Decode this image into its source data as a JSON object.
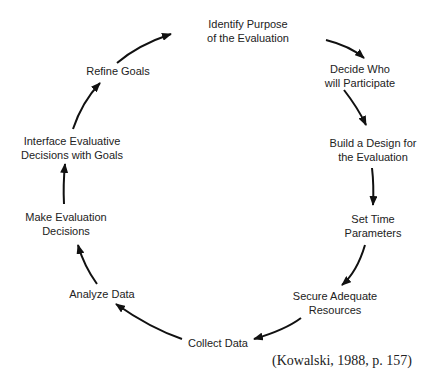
{
  "diagram": {
    "type": "cycle",
    "steps": [
      {
        "line1": "Identify Purpose",
        "line2": "of the Evaluation"
      },
      {
        "line1": "Decide Who",
        "line2": "will Participate"
      },
      {
        "line1": "Build a Design for",
        "line2": "the Evaluation"
      },
      {
        "line1": "Set Time",
        "line2": "Parameters"
      },
      {
        "line1": "Secure Adequate",
        "line2": "Resources"
      },
      {
        "line1": "Collect Data",
        "line2": ""
      },
      {
        "line1": "Analyze Data",
        "line2": ""
      },
      {
        "line1": "Make Evaluation",
        "line2": "Decisions"
      },
      {
        "line1": "Interface Evaluative",
        "line2": "Decisions with Goals"
      },
      {
        "line1": "Refine Goals",
        "line2": ""
      }
    ],
    "citation": "(Kowalski, 1988, p. 157)",
    "arrow_color": "#111111"
  }
}
